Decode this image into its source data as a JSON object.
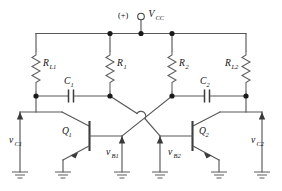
{
  "figure": {
    "kind": "schematic-diagram",
    "background_color": "#ffffff",
    "wire_color": "#585858",
    "label_color": "#111111",
    "node_color": "#1a1a1a"
  },
  "supply": {
    "polarity_label": "(+)",
    "terminal_icon": "open-circle-terminal",
    "symbol": "V",
    "subscript": "CC"
  },
  "resistors": [
    {
      "id": "RL1",
      "symbol": "R",
      "subscript": "L1",
      "label": "R_L1"
    },
    {
      "id": "R1",
      "symbol": "R",
      "subscript": "1",
      "label": "R_1"
    },
    {
      "id": "R2",
      "symbol": "R",
      "subscript": "2",
      "label": "R_2"
    },
    {
      "id": "RL2",
      "symbol": "R",
      "subscript": "L2",
      "label": "R_L2"
    }
  ],
  "capacitors": [
    {
      "id": "C1",
      "symbol": "C",
      "subscript": "1",
      "label": "C_1"
    },
    {
      "id": "C2",
      "symbol": "C",
      "subscript": "2",
      "label": "C_2"
    }
  ],
  "transistors": [
    {
      "id": "Q1",
      "symbol": "Q",
      "subscript": "1",
      "label": "Q_1",
      "type": "npn"
    },
    {
      "id": "Q2",
      "symbol": "Q",
      "subscript": "2",
      "label": "Q_2",
      "type": "npn"
    }
  ],
  "voltages": [
    {
      "id": "vC1",
      "symbol": "v",
      "subscript": "C1",
      "label": "v_C1",
      "position": "left-output"
    },
    {
      "id": "vB1",
      "symbol": "v",
      "subscript": "B1",
      "label": "v_B1",
      "position": "left-base"
    },
    {
      "id": "vB2",
      "symbol": "v",
      "subscript": "B2",
      "label": "v_B2",
      "position": "right-base"
    },
    {
      "id": "vC2",
      "symbol": "v",
      "subscript": "C2",
      "label": "v_C2",
      "position": "right-output"
    }
  ],
  "grounds": {
    "count": 6,
    "style": "three-bar-earth"
  },
  "crossing": {
    "style": "wire-hop",
    "connected": false
  }
}
